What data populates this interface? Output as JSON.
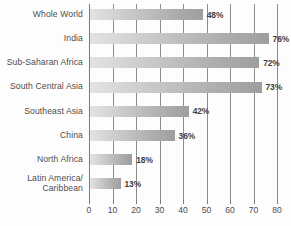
{
  "chart_data": {
    "type": "bar",
    "orientation": "horizontal",
    "title": "",
    "xlabel": "",
    "ylabel": "",
    "xlim": [
      0,
      80
    ],
    "grid": true,
    "legend": false,
    "categories": [
      "Whole World",
      "India",
      "Sub-Saharan Africa",
      "South Central Asia",
      "Southeast Asia",
      "China",
      "North Africa",
      "Latin America/\nCaribbean"
    ],
    "values": [
      48,
      76,
      72,
      73,
      42,
      36,
      18,
      13
    ],
    "value_labels": [
      "48%",
      "76%",
      "72%",
      "73%",
      "42%",
      "36%",
      "18%",
      "13%"
    ],
    "xticks": [
      0,
      10,
      20,
      30,
      40,
      50,
      60,
      70,
      80
    ],
    "xtick_labels": [
      "0",
      "10",
      "20",
      "30",
      "40",
      "50",
      "60",
      "70",
      "80"
    ],
    "bar_color_start": "#e3e3e3",
    "bar_color_end": "#9e9e9e",
    "gridline_color": "#8c8c8c",
    "text_color": "#4d4d4d",
    "background": "#fdfdfd"
  }
}
